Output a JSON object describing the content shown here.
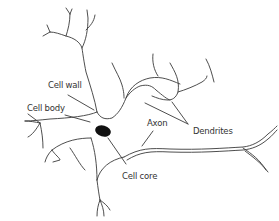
{
  "diagram": {
    "colors": {
      "line": "#3a3a3a",
      "text": "#333333",
      "nucleus": "#111111",
      "background": "#ffffff"
    },
    "labels": {
      "cell_wall": "Cell wall",
      "cell_body": "Cell body",
      "axon": "Axon",
      "dendrites": "Dendrites",
      "cell_core": "Cell core"
    }
  }
}
